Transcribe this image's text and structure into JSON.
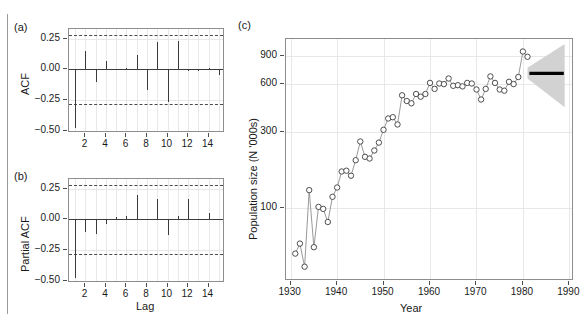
{
  "figure": {
    "panels": [
      "a",
      "b",
      "c"
    ]
  },
  "panel_a": {
    "tag": "(a)",
    "ylabel": "ACF",
    "xlabel": "",
    "chart_data": {
      "type": "bar",
      "title": "",
      "xlabel": "Lag",
      "ylabel": "ACF",
      "xlim": [
        0.4,
        15.6
      ],
      "ylim": [
        -0.52,
        0.33
      ],
      "yticks": [
        0.25,
        0.0,
        -0.25,
        -0.5
      ],
      "ytick_labels": [
        "0.25",
        "0.00",
        "-0.25",
        "-0.50"
      ],
      "xticks": [
        2,
        4,
        6,
        8,
        10,
        12,
        14
      ],
      "xtick_labels": [
        "2",
        "4",
        "6",
        "8",
        "10",
        "12",
        "14"
      ],
      "grid": true,
      "confidence_bounds": [
        0.28,
        -0.28
      ],
      "confidence_style": "dashed",
      "categories": [
        1,
        2,
        3,
        4,
        5,
        6,
        7,
        8,
        9,
        10,
        11,
        12,
        13,
        14,
        15
      ],
      "values": [
        -0.48,
        0.15,
        -0.11,
        0.07,
        0.0,
        0.01,
        0.12,
        -0.17,
        0.22,
        -0.27,
        0.23,
        -0.02,
        -0.02,
        0.01,
        -0.05
      ]
    }
  },
  "panel_b": {
    "tag": "(b)",
    "ylabel": "Partial ACF",
    "xlabel": "Lag",
    "chart_data": {
      "type": "bar",
      "title": "",
      "xlabel": "Lag",
      "ylabel": "Partial ACF",
      "xlim": [
        0.4,
        15.6
      ],
      "ylim": [
        -0.52,
        0.33
      ],
      "yticks": [
        0.25,
        0.0,
        -0.25,
        -0.5
      ],
      "ytick_labels": [
        "0.25",
        "0.00",
        "-0.25",
        "-0.50"
      ],
      "xticks": [
        2,
        4,
        6,
        8,
        10,
        12,
        14
      ],
      "xtick_labels": [
        "2",
        "4",
        "6",
        "8",
        "10",
        "12",
        "14"
      ],
      "grid": true,
      "confidence_bounds": [
        0.28,
        -0.28
      ],
      "confidence_style": "dashed",
      "categories": [
        1,
        2,
        3,
        4,
        5,
        6,
        7,
        8,
        9,
        10,
        11,
        12,
        13,
        14,
        15
      ],
      "values": [
        -0.48,
        -0.11,
        -0.12,
        -0.04,
        0.02,
        0.03,
        0.2,
        -0.01,
        0.17,
        -0.13,
        0.03,
        0.17,
        0.0,
        0.05,
        -0.01
      ]
    }
  },
  "panel_c": {
    "tag": "(c)",
    "ylabel": "Population size (N '000s)",
    "xlabel": "Year",
    "chart_data": {
      "type": "line",
      "title": "",
      "xlabel": "Year",
      "ylabel": "Population size (N '000s)",
      "yscale": "log",
      "xlim": [
        1929,
        1991
      ],
      "ylim": [
        35,
        1150
      ],
      "yticks": [
        100,
        300,
        600,
        900
      ],
      "ytick_labels": [
        "100",
        "300",
        "600",
        "900"
      ],
      "xticks": [
        1930,
        1940,
        1950,
        1960,
        1970,
        1980,
        1990
      ],
      "xtick_labels": [
        "1930",
        "1940",
        "1950",
        "1960",
        "1970",
        "1980",
        "1990"
      ],
      "grid": true,
      "marker": "open-circle",
      "series": [
        {
          "name": "Observed population size",
          "x": [
            1931,
            1932,
            1933,
            1934,
            1935,
            1936,
            1937,
            1938,
            1939,
            1940,
            1941,
            1942,
            1943,
            1944,
            1945,
            1946,
            1947,
            1948,
            1949,
            1950,
            1951,
            1952,
            1953,
            1954,
            1955,
            1956,
            1957,
            1958,
            1959,
            1960,
            1961,
            1962,
            1963,
            1964,
            1965,
            1966,
            1967,
            1968,
            1969,
            1970,
            1971,
            1972,
            1973,
            1974,
            1975,
            1976,
            1977,
            1978,
            1979,
            1980,
            1981
          ],
          "y": [
            52,
            60,
            43,
            130,
            57,
            102,
            99,
            82,
            118,
            135,
            170,
            172,
            160,
            200,
            262,
            210,
            205,
            230,
            258,
            310,
            365,
            372,
            335,
            510,
            470,
            455,
            520,
            500,
            520,
            610,
            560,
            605,
            600,
            650,
            585,
            590,
            580,
            610,
            605,
            555,
            480,
            560,
            670,
            610,
            555,
            545,
            620,
            600,
            665,
            960,
            890
          ]
        }
      ],
      "forecast": {
        "x_start": 1981,
        "x_end": 1989,
        "point_forecast": 700,
        "band_upper_start": 760,
        "band_upper_end": 1070,
        "band_lower_start": 650,
        "band_lower_end": 430,
        "band_color": "#d2d2d2",
        "line_color": "#000000"
      }
    }
  },
  "style": {
    "line_color": "#8d8d8d",
    "marker_fill": "#ffffff",
    "marker_stroke": "#3b3b3b",
    "bar_color": "#3b3b3b",
    "grid_color": "#e8e8e8",
    "axis_color": "#8d8d8d"
  }
}
